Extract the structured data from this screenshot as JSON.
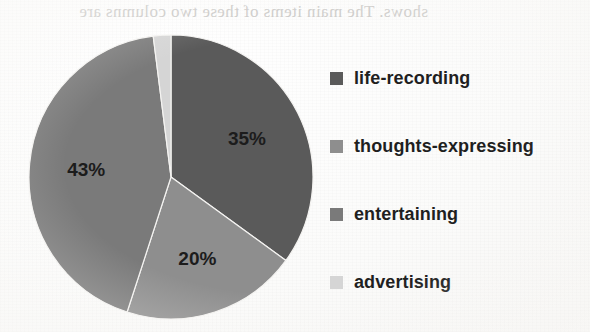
{
  "background_artifact": {
    "name": "bleed-through-text",
    "text": "shows. The main items of these two columns are"
  },
  "chart_data": {
    "type": "pie",
    "title": "",
    "categories": [
      "life-recording",
      "thoughts-expressing",
      "entertaining",
      "advertising"
    ],
    "values": [
      35,
      20,
      43,
      2
    ],
    "value_labels": [
      "35%",
      "20%",
      "43%",
      "2%"
    ],
    "colors": [
      "#5a5a5a",
      "#8e8e8e",
      "#7a7a7a",
      "#d5d5d5"
    ],
    "start_angle_deg": 0,
    "direction": "clockwise",
    "legend_position": "right",
    "grid": false,
    "xlabel": "",
    "ylabel": ""
  },
  "legend": {
    "items": [
      {
        "label": "life-recording",
        "color": "#5a5a5a"
      },
      {
        "label": "thoughts-expressing",
        "color": "#8e8e8e"
      },
      {
        "label": "entertaining",
        "color": "#7a7a7a"
      },
      {
        "label": "advertising",
        "color": "#d5d5d5"
      }
    ]
  }
}
